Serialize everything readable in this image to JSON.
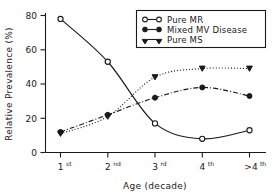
{
  "chart_data": {
    "type": "line",
    "title": "",
    "xlabel": "Age (decade)",
    "ylabel": "Relative Prevalence (%)",
    "categories": [
      "1st",
      "2nd",
      "3rd",
      "4th",
      ">4th"
    ],
    "category_bases": [
      "1",
      "2",
      "3",
      "4",
      ">4"
    ],
    "category_supers": [
      "st",
      "nd",
      "rd",
      "th",
      "th"
    ],
    "ylim": [
      0,
      80
    ],
    "yticks": [
      0,
      20,
      40,
      60,
      80
    ],
    "ytick_labels": [
      "0",
      "20",
      "40",
      "60",
      "80"
    ],
    "grid": false,
    "legend_position": "top-right",
    "series": [
      {
        "name": "Pure MR",
        "marker": "open-circle",
        "linestyle": "solid",
        "values": [
          78,
          53,
          17,
          8,
          13
        ]
      },
      {
        "name": "Mixed MV Disease",
        "marker": "filled-circle",
        "linestyle": "dash-dot",
        "values": [
          12,
          22,
          32,
          38,
          33
        ]
      },
      {
        "name": "Pure MS",
        "marker": "filled-triangle-down",
        "linestyle": "dotted",
        "values": [
          11,
          21,
          44,
          49,
          49
        ]
      }
    ]
  },
  "colors": {
    "ink": "#1a1a1a",
    "background": "#ffffff"
  }
}
